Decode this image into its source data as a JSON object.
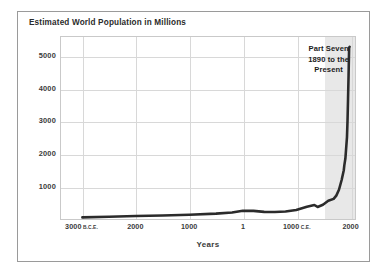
{
  "figure": {
    "title": "Estimated World Population in Millions",
    "background_color": "#ffffff",
    "frame_color": "#9a9a9a"
  },
  "annotation": {
    "line1": "Part Seven",
    "line2": "1890 to the",
    "line3": "Present"
  },
  "chart_data": {
    "type": "line",
    "title": "Estimated World Population in Millions",
    "xlabel": "Years",
    "ylabel": "",
    "xlim": [
      -3400,
      2100
    ],
    "ylim": [
      0,
      5600
    ],
    "grid": true,
    "legend": null,
    "line_color": "#2b2b2b",
    "line_width": 2.6,
    "shaded_region": {
      "label": "Part Seven 1890 to the Present",
      "x_start": 1500,
      "x_end": 2100,
      "color": "#e8e8e8"
    },
    "y_ticks": [
      1000,
      2000,
      3000,
      4000,
      5000
    ],
    "y_tick_labels": [
      "1000",
      "2000",
      "3000",
      "4000",
      "5000"
    ],
    "x_ticks": [
      -3000,
      -2000,
      -1000,
      1,
      1000,
      2000
    ],
    "x_tick_labels": [
      {
        "value": "3000",
        "suffix": "B.C.E."
      },
      {
        "value": "2000",
        "suffix": ""
      },
      {
        "value": "1000",
        "suffix": ""
      },
      {
        "value": "1",
        "suffix": ""
      },
      {
        "value": "1000",
        "suffix": "C.E."
      },
      {
        "value": "2000",
        "suffix": ""
      }
    ],
    "x": [
      -3000,
      -2500,
      -2000,
      -1500,
      -1000,
      -500,
      -200,
      1,
      200,
      400,
      600,
      800,
      1000,
      1200,
      1340,
      1400,
      1500,
      1600,
      1700,
      1750,
      1800,
      1850,
      1890,
      1900,
      1920,
      1950,
      1960,
      1970,
      1980,
      1990,
      2000
    ],
    "values": [
      50,
      70,
      95,
      110,
      130,
      165,
      200,
      255,
      250,
      220,
      215,
      230,
      280,
      380,
      430,
      370,
      440,
      560,
      620,
      720,
      900,
      1200,
      1500,
      1650,
      1860,
      2520,
      3020,
      3700,
      4430,
      5270,
      5300
    ],
    "series": [
      {
        "name": "World population (millions)",
        "values": [
          50,
          70,
          95,
          110,
          130,
          165,
          200,
          255,
          250,
          220,
          215,
          230,
          280,
          380,
          430,
          370,
          440,
          560,
          620,
          720,
          900,
          1200,
          1500,
          1650,
          1860,
          2520,
          3020,
          3700,
          4430,
          5270,
          5300
        ]
      }
    ]
  }
}
